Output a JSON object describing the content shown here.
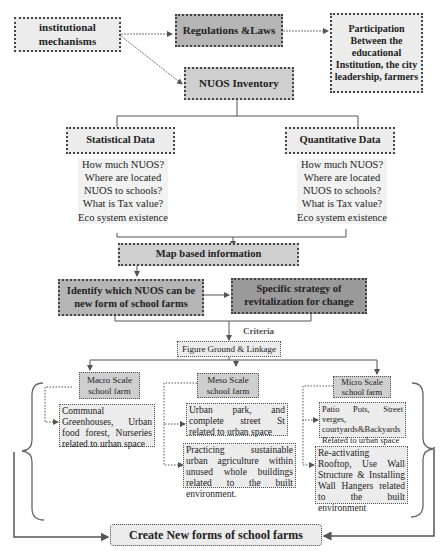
{
  "nodes": {
    "institutional": "institutional mechanisms",
    "regulations": "Regulations &Laws",
    "participation": "Participation Between the educational Institution, the city leadership, farmers",
    "inventory": "NUOS Inventory",
    "statistical": "Statistical Data",
    "quantitative": "Quantitative Data",
    "map_based": "Map based information",
    "identify": "Identify which NUOS can be new form of school farms",
    "strategy": "Specific strategy of revitalization for change",
    "criteria": "Criteria",
    "figure_ground": "Figure Ground & Linkage",
    "macro": "Macro Scale school farm",
    "meso": "Meso Scale school farm",
    "micro": "Micro Scale school farm",
    "macro_item": "Communal Greenhouses, Urban food forest, Nurseries related to urban space",
    "meso_item1": "Urban park, and complete street St related to urban space",
    "meso_item2": "Practicing sustainable urban agriculture within unused whole buildings related to the built environment.",
    "micro_item1": "Patio Pots, Street verges, courtyards&Backyards Related to urban space",
    "micro_item2": "Re-activating Rooftop, Use Wall Structure & Installing Wall Hangers related to the built environment",
    "create": "Create New forms of school farms"
  },
  "questions": {
    "statistical": [
      "How much NUOS?",
      "Where are located",
      "NUOS to schools?",
      "What is Tax value?",
      "Eco system existence"
    ],
    "quantitative": [
      "How much NUOS?",
      "Where are located",
      "NUOS to schools?",
      "What is Tax value?",
      "Eco system existence"
    ]
  }
}
